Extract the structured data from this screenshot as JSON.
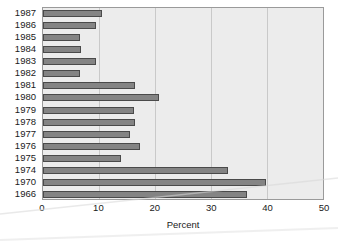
{
  "chart_data": {
    "type": "bar",
    "orientation": "horizontal",
    "title": "",
    "xlabel": "Percent",
    "ylabel": "",
    "xlim": [
      0,
      50
    ],
    "xticks": [
      0,
      10,
      20,
      30,
      40,
      50
    ],
    "grid": true,
    "legend": false,
    "categories": [
      "1987",
      "1986",
      "1985",
      "1984",
      "1983",
      "1982",
      "1981",
      "1980",
      "1979",
      "1978",
      "1977",
      "1976",
      "1975",
      "1974",
      "1970",
      "1966"
    ],
    "values": [
      10.5,
      9.5,
      6.6,
      6.8,
      9.4,
      6.6,
      16.5,
      20.7,
      16.2,
      16.4,
      15.5,
      17.4,
      13.9,
      33.1,
      39.9,
      36.5
    ],
    "colors": {
      "bar_fill": "#848484",
      "bar_edge": "#4a4a4a",
      "panel_background": "#ececec",
      "gridline": "#c9c9c9",
      "axis_border": "#9a9a9a",
      "text": "#1a1a1a",
      "figure_background": "#ffffff"
    }
  }
}
